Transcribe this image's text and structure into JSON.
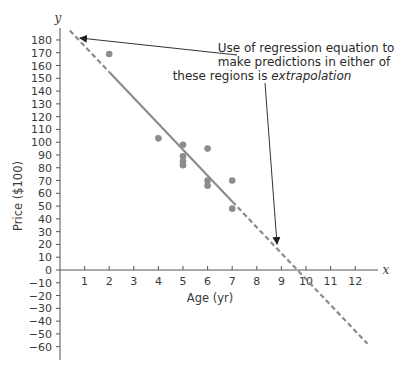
{
  "chart_data": {
    "type": "scatter",
    "title": "",
    "xlabel": "Age (yr)",
    "ylabel": "Price ($100)",
    "x_axis_var": "x",
    "y_axis_var": "y",
    "xlim": [
      0,
      13
    ],
    "ylim": [
      -70,
      185
    ],
    "x_ticks": [
      1,
      2,
      3,
      4,
      5,
      6,
      7,
      8,
      9,
      10,
      11,
      12
    ],
    "y_ticks": [
      180,
      170,
      160,
      150,
      140,
      130,
      120,
      110,
      100,
      90,
      80,
      70,
      60,
      50,
      40,
      30,
      20,
      10,
      0,
      -10,
      -20,
      -30,
      -40,
      -50,
      -60
    ],
    "grid": false,
    "points": [
      {
        "x": 2,
        "y": 169
      },
      {
        "x": 4,
        "y": 103
      },
      {
        "x": 5,
        "y": 98
      },
      {
        "x": 5,
        "y": 89
      },
      {
        "x": 5,
        "y": 85
      },
      {
        "x": 5,
        "y": 82
      },
      {
        "x": 6,
        "y": 95
      },
      {
        "x": 6,
        "y": 70
      },
      {
        "x": 6,
        "y": 66
      },
      {
        "x": 7,
        "y": 70
      },
      {
        "x": 7,
        "y": 48
      }
    ],
    "regression_line": {
      "intercept": 195.47,
      "slope": -20.26,
      "solid_range": [
        2,
        7
      ],
      "dashed_ranges": [
        [
          0.4,
          2
        ],
        [
          7,
          12.5
        ]
      ]
    },
    "annotation": {
      "lines": [
        "Use of regression equation to",
        "make predictions in either of",
        "these regions is "
      ],
      "emphasis": "extrapolation"
    },
    "colors": {
      "points": "#8c8c8c",
      "line": "#8c8c8c",
      "axis": "#555555",
      "text": "#333333"
    }
  }
}
